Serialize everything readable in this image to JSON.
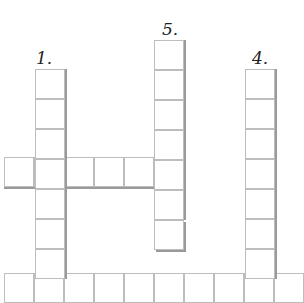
{
  "puzzle": {
    "type": "crossword",
    "cell_size": 30,
    "clues": [
      {
        "number": "1.",
        "label_x": 36,
        "label_y": 50,
        "direction": "down",
        "start_x": 35,
        "start_y": 69,
        "length": 7
      },
      {
        "number": "5.",
        "label_x": 162,
        "label_y": 21,
        "direction": "down",
        "start_x": 154,
        "start_y": 40,
        "length": 7
      },
      {
        "number": "4.",
        "label_x": 252,
        "label_y": 50,
        "direction": "down",
        "start_x": 245,
        "start_y": 69,
        "length": 7
      }
    ],
    "across_rows": [
      {
        "name": "middle-across",
        "start_x": 4,
        "start_y": 157,
        "length": 6
      },
      {
        "name": "bottom-across",
        "start_x": 4,
        "start_y": 273,
        "length": 10
      }
    ],
    "colors": {
      "cell_border": "#bdbdbd",
      "shadow": "#9a9a9a",
      "background": "#ffffff",
      "text": "#222222"
    }
  }
}
